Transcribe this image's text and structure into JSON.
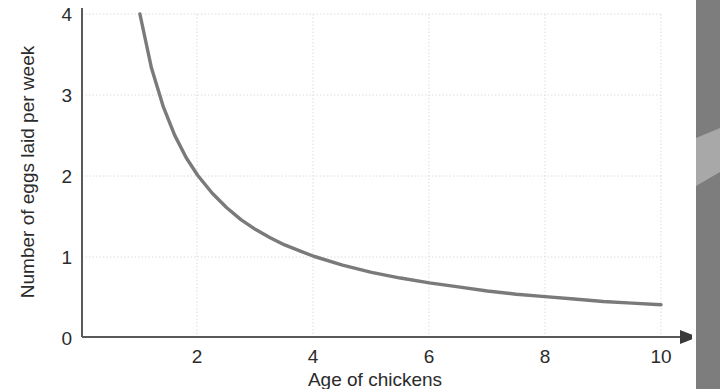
{
  "chart_data": {
    "type": "line",
    "title": "",
    "xlabel": "Age of chickens",
    "ylabel": "Number of eggs laid per week",
    "xlim": [
      0,
      10.55
    ],
    "ylim": [
      0,
      4.15
    ],
    "xticks": [
      2,
      4,
      6,
      8,
      10
    ],
    "xtick_labels": [
      "2",
      "4",
      "6",
      "8",
      "10"
    ],
    "yticks": [
      0,
      1,
      2,
      3,
      4
    ],
    "ytick_labels": [
      "0",
      "1",
      "2",
      "3",
      "4"
    ],
    "grid": "dotted light gray gridlines at each tick",
    "legend": "none",
    "series": [
      {
        "name": "eggs per week",
        "relationship": "y = 4 / x (inverse proportion)",
        "x": [
          1.0,
          1.2,
          1.4,
          1.6,
          1.8,
          2.0,
          2.25,
          2.5,
          2.75,
          3.0,
          3.25,
          3.5,
          3.75,
          4.0,
          4.5,
          5.0,
          5.5,
          6.0,
          6.5,
          7.0,
          7.5,
          8.0,
          8.5,
          9.0,
          9.5,
          10.0
        ],
        "y": [
          4.0,
          3.33,
          2.86,
          2.5,
          2.22,
          2.0,
          1.78,
          1.6,
          1.45,
          1.33,
          1.23,
          1.14,
          1.07,
          1.0,
          0.89,
          0.8,
          0.73,
          0.67,
          0.62,
          0.57,
          0.53,
          0.5,
          0.47,
          0.44,
          0.42,
          0.4
        ],
        "color": "#7a7a7a"
      }
    ]
  },
  "axes": {
    "x_title": "Age of chickens",
    "y_title": "Number of eggs laid per week",
    "x_tick_2": "2",
    "x_tick_4": "4",
    "x_tick_6": "6",
    "x_tick_8": "8",
    "x_tick_10": "10",
    "y_tick_0": "0",
    "y_tick_1": "1",
    "y_tick_2": "2",
    "y_tick_3": "3",
    "y_tick_4": "4"
  },
  "colors": {
    "curve": "#7a7a7a",
    "axis": "#5a5a5a",
    "gridline": "#dcdcdc",
    "text": "#2b2b2b",
    "background": "#ffffff",
    "side_strip_dark": "#7d7d7d",
    "side_strip_light": "#a8a8a8"
  }
}
